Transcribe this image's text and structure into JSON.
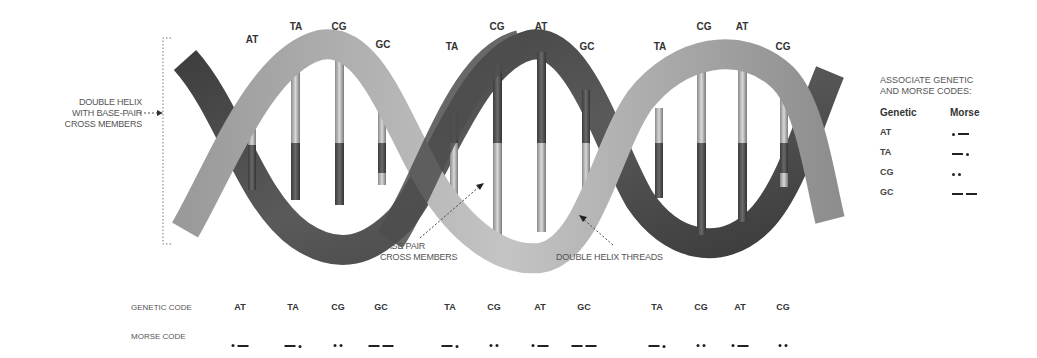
{
  "diagram": {
    "left_annotation": [
      "DOUBLE HELIX",
      "WITH BASE-PAIR",
      "CROSS MEMBERS"
    ],
    "base_pair_annotation": [
      "BASE PAIR",
      "CROSS MEMBERS"
    ],
    "threads_annotation": "DOUBLE HELIX THREADS",
    "helix_labels": [
      {
        "text": "AT",
        "x": 252,
        "y": 40
      },
      {
        "text": "TA",
        "x": 296,
        "y": 27
      },
      {
        "text": "CG",
        "x": 339,
        "y": 27
      },
      {
        "text": "GC",
        "x": 383,
        "y": 45
      },
      {
        "text": "TA",
        "x": 452,
        "y": 47
      },
      {
        "text": "CG",
        "x": 497,
        "y": 27
      },
      {
        "text": "AT",
        "x": 541,
        "y": 27
      },
      {
        "text": "GC",
        "x": 587,
        "y": 47
      },
      {
        "text": "TA",
        "x": 660,
        "y": 47
      },
      {
        "text": "CG",
        "x": 704,
        "y": 27
      },
      {
        "text": "AT",
        "x": 742,
        "y": 27
      },
      {
        "text": "CG",
        "x": 783,
        "y": 47
      }
    ],
    "colors": {
      "strand_dark": "#4a4a4a",
      "strand_light": "#a8a8a8",
      "text": "#333333"
    }
  },
  "legend": {
    "title": [
      "ASSOCIATE GENETIC",
      "AND MORSE CODES:"
    ],
    "col_genetic": "Genetic",
    "col_morse": "Morse",
    "rows": [
      {
        "code": "AT",
        "morse": ".-"
      },
      {
        "code": "TA",
        "morse": "-."
      },
      {
        "code": "CG",
        "morse": ".."
      },
      {
        "code": "GC",
        "morse": "--"
      }
    ]
  },
  "sequence": {
    "genetic_label": "GENETIC CODE",
    "morse_label": "MORSE CODE",
    "items": [
      {
        "code": "AT",
        "morse": ".-",
        "x": 240
      },
      {
        "code": "TA",
        "morse": "-.",
        "x": 293
      },
      {
        "code": "CG",
        "morse": "..",
        "x": 338
      },
      {
        "code": "GC",
        "morse": "--",
        "x": 381
      },
      {
        "code": "TA",
        "morse": "-.",
        "x": 450
      },
      {
        "code": "CG",
        "morse": "..",
        "x": 494
      },
      {
        "code": "AT",
        "morse": ".-",
        "x": 540
      },
      {
        "code": "GC",
        "morse": "--",
        "x": 584
      },
      {
        "code": "TA",
        "morse": "-.",
        "x": 657
      },
      {
        "code": "CG",
        "morse": "..",
        "x": 701
      },
      {
        "code": "AT",
        "morse": ".-",
        "x": 740
      },
      {
        "code": "CG",
        "morse": "..",
        "x": 783
      }
    ]
  }
}
